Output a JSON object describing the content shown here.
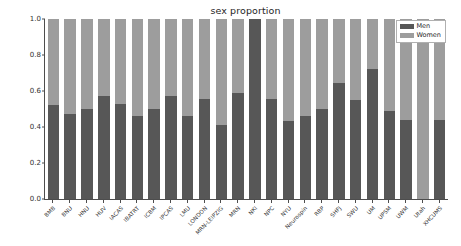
{
  "chart_data": {
    "type": "bar",
    "subtype": "stacked-proportion",
    "title": "sex proportion",
    "xlabel": "",
    "ylabel": "",
    "ylim": [
      0.0,
      1.0
    ],
    "yticks": [
      "1.0",
      "0.8",
      "0.6",
      "0.4",
      "0.2",
      "0.0"
    ],
    "ytick_values": [
      1.0,
      0.8,
      0.6,
      0.4,
      0.2,
      0.0
    ],
    "grid": false,
    "legend_position": "upper right",
    "categories": [
      "BMB",
      "BNU",
      "HNU",
      "HUV",
      "IACAS",
      "IBATRT",
      "ICBM",
      "IPCAS",
      "LMU",
      "LONDON",
      "MRN-LEIPZIG",
      "MRN",
      "NKI",
      "NPC",
      "NYU",
      "Neurospin",
      "RBP",
      "SHFJ",
      "SWU",
      "UM",
      "UPSM",
      "UWM",
      "Utah",
      "XHCUMS"
    ],
    "series": [
      {
        "name": "Men",
        "color": "#575757",
        "values": [
          0.52,
          0.47,
          0.5,
          0.575,
          0.53,
          0.46,
          0.5,
          0.575,
          0.46,
          0.555,
          0.41,
          0.59,
          1.0,
          0.555,
          0.435,
          0.46,
          0.5,
          0.645,
          0.55,
          0.725,
          0.49,
          0.44,
          0.0,
          0.44
        ]
      },
      {
        "name": "Women",
        "color": "#9d9d9d",
        "values": [
          0.48,
          0.53,
          0.5,
          0.425,
          0.47,
          0.54,
          0.5,
          0.425,
          0.54,
          0.445,
          0.59,
          0.41,
          0.0,
          0.445,
          0.565,
          0.54,
          0.5,
          0.355,
          0.45,
          0.275,
          0.51,
          0.56,
          1.0,
          0.56
        ]
      }
    ]
  },
  "legend": {
    "entries": [
      {
        "label": "Men",
        "color": "#575757"
      },
      {
        "label": "Women",
        "color": "#9d9d9d"
      }
    ]
  }
}
